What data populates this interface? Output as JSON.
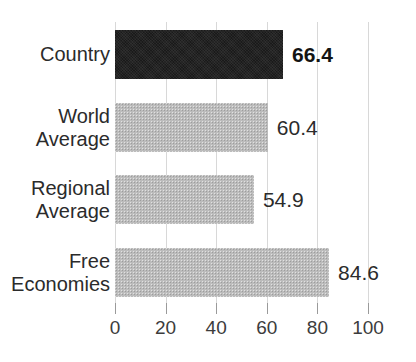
{
  "chart": {
    "type": "bar",
    "orientation": "horizontal",
    "title": "",
    "title_note": "title cropped off at top of image",
    "xlabel": "",
    "ylabel": ""
  },
  "chart_data": {
    "type": "bar",
    "title": "",
    "xlabel": "",
    "ylabel": "",
    "orientation": "horizontal",
    "categories": [
      "Country",
      "World\nAverage",
      "Regional\nAverage",
      "Free\nEconomies"
    ],
    "values": [
      66.4,
      60.4,
      54.9,
      84.6
    ],
    "value_labels": [
      "66.4",
      "60.4",
      "54.9",
      "84.6"
    ],
    "bar_styles": [
      "solid-dark",
      "halftone-gray",
      "halftone-gray",
      "halftone-gray"
    ],
    "highlight_index": 0,
    "xlim": [
      0,
      100
    ],
    "xticks": [
      0,
      20,
      40,
      60,
      80,
      100
    ],
    "xtick_labels": [
      "0",
      "20",
      "40",
      "60",
      "80",
      "100"
    ],
    "grid": "vertical",
    "legend": "none",
    "colors": {
      "bar_dark": "#1a1a1a",
      "bar_light": "#bcbcbc",
      "gridline": "#d8d8d8",
      "text": "#2b2b2b",
      "background": "#ffffff"
    }
  },
  "axis": {
    "ticks": [
      {
        "value": 0,
        "label": "0"
      },
      {
        "value": 20,
        "label": "20"
      },
      {
        "value": 40,
        "label": "40"
      },
      {
        "value": 60,
        "label": "60"
      },
      {
        "value": 80,
        "label": "80"
      },
      {
        "value": 100,
        "label": "100"
      }
    ]
  },
  "rows": [
    {
      "label": "Country",
      "value": 66.4,
      "value_label": "66.4",
      "style": "dark",
      "bold_value": true
    },
    {
      "label": "World\nAverage",
      "value": 60.4,
      "value_label": "60.4",
      "style": "light",
      "bold_value": false
    },
    {
      "label": "Regional\nAverage",
      "value": 54.9,
      "value_label": "54.9",
      "style": "light",
      "bold_value": false
    },
    {
      "label": "Free\nEconomies",
      "value": 84.6,
      "value_label": "84.6",
      "style": "light",
      "bold_value": false
    }
  ]
}
